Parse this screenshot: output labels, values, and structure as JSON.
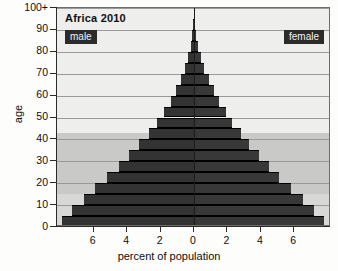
{
  "chart_data": {
    "type": "bar",
    "subtype": "population-pyramid",
    "title": "Africa 2010",
    "xlabel": "percent of population",
    "ylabel": "age",
    "xlim": [
      -8.2,
      8.2
    ],
    "ylim": [
      0,
      100
    ],
    "grid": true,
    "legend_position": "inside-top",
    "xtick_labels": [
      "6",
      "4",
      "2",
      "0",
      "2",
      "4",
      "6"
    ],
    "xtick_values": [
      -6,
      -4,
      -2,
      0,
      2,
      4,
      6
    ],
    "ytick_labels": [
      "0",
      "10",
      "20",
      "30",
      "40",
      "50",
      "60",
      "70",
      "80",
      "90",
      "100+"
    ],
    "ytick_values": [
      0,
      10,
      20,
      30,
      40,
      50,
      60,
      70,
      80,
      90,
      100
    ],
    "categories": [
      "0-4",
      "5-9",
      "10-14",
      "15-19",
      "20-24",
      "25-29",
      "30-34",
      "35-39",
      "40-44",
      "45-49",
      "50-54",
      "55-59",
      "60-64",
      "65-69",
      "70-74",
      "75-79",
      "80-84",
      "85-89",
      "90-94",
      "95-99",
      "100+"
    ],
    "series": [
      {
        "name": "male",
        "side": "left",
        "color": "#333333",
        "values": [
          7.9,
          7.3,
          6.6,
          5.9,
          5.2,
          4.5,
          3.9,
          3.3,
          2.7,
          2.2,
          1.8,
          1.4,
          1.1,
          0.8,
          0.55,
          0.35,
          0.2,
          0.1,
          0.04,
          0.015,
          0.005
        ]
      },
      {
        "name": "female",
        "side": "right",
        "color": "#383838",
        "values": [
          7.8,
          7.2,
          6.5,
          5.8,
          5.1,
          4.5,
          3.9,
          3.3,
          2.8,
          2.3,
          1.9,
          1.5,
          1.2,
          0.9,
          0.62,
          0.4,
          0.24,
          0.12,
          0.05,
          0.018,
          0.006
        ]
      }
    ],
    "bands": [
      {
        "name": "youth-band",
        "from": 0,
        "to": 15,
        "color": "#d8d8d6"
      },
      {
        "name": "working-band",
        "from": 15,
        "to": 45,
        "color": "#c9c9c7"
      },
      {
        "name": "older-band",
        "from": 45,
        "to": 100,
        "color": "#eeeeed"
      }
    ]
  },
  "legend": {
    "male_label": "male",
    "female_label": "female"
  }
}
